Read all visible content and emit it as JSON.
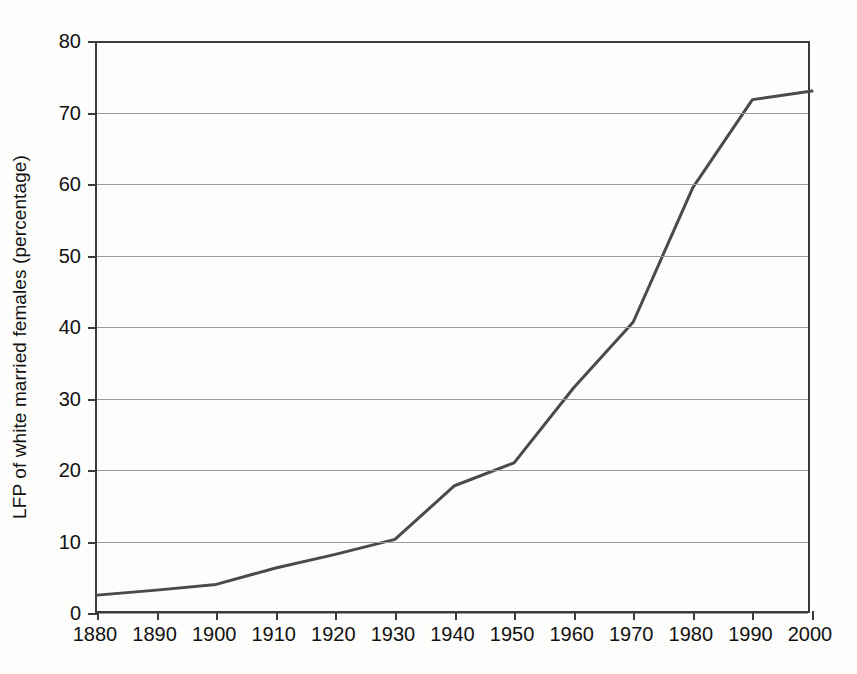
{
  "chart_data": {
    "type": "line",
    "title": "",
    "subtitle": "",
    "xlabel": "",
    "ylabel": "LFP of white married females (percentage)",
    "x": [
      1880,
      1890,
      1900,
      1910,
      1920,
      1930,
      1940,
      1950,
      1960,
      1970,
      1980,
      1990,
      2000
    ],
    "xtick_labels": [
      "1880",
      "1890",
      "1900",
      "1910",
      "1920",
      "1930",
      "1940",
      "1950",
      "1960",
      "1970",
      "1980",
      "1990",
      "2000"
    ],
    "xlim": [
      1880,
      2000
    ],
    "ylim": [
      0,
      80
    ],
    "ytick_values": [
      0,
      10,
      20,
      30,
      40,
      50,
      60,
      70,
      80
    ],
    "ytick_labels": [
      "0",
      "10",
      "20",
      "30",
      "40",
      "50",
      "60",
      "70",
      "80"
    ],
    "grid": "horizontal",
    "legend": "none",
    "series": [
      {
        "name": "LFP of white married females",
        "color": "#4a4a4a",
        "line_width": 3,
        "values": [
          2.5,
          3.2,
          4.0,
          6.3,
          8.2,
          10.3,
          17.8,
          21.0,
          31.5,
          40.7,
          59.5,
          71.8,
          73.0
        ]
      }
    ]
  },
  "figure": {
    "background": "#fdfdfc",
    "axis_color": "#3b3b3b",
    "grid_color": "#9a9a9a",
    "text_color": "#111111"
  }
}
